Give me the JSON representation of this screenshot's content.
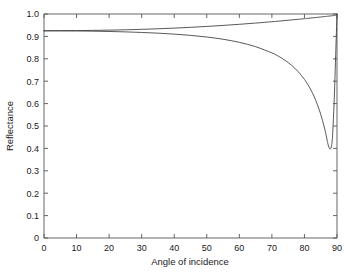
{
  "chart_data": {
    "type": "line",
    "title": "",
    "xlabel": "Angle of incidence",
    "ylabel": "Reflectance",
    "xlim": [
      0,
      90
    ],
    "ylim": [
      0,
      1.0
    ],
    "grid": false,
    "legend": "none",
    "xticks": [
      0,
      10,
      20,
      30,
      40,
      50,
      60,
      70,
      80,
      90
    ],
    "xtick_labels": [
      "0",
      "10",
      "20",
      "30",
      "40",
      "50",
      "60",
      "70",
      "80",
      "90"
    ],
    "yticks": [
      0,
      0.1,
      0.2,
      0.3,
      0.4,
      0.5,
      0.6,
      0.7,
      0.8,
      0.9,
      1.0
    ],
    "ytick_labels": [
      "0",
      "0.1",
      "0.2",
      "0.3",
      "0.4",
      "0.5",
      "0.6",
      "0.7",
      "0.8",
      "0.9",
      "1.0"
    ],
    "line_color": "#3a3a3a",
    "axis_color": "#555555",
    "background": "#ffffff",
    "x": [
      0,
      5,
      10,
      15,
      20,
      25,
      30,
      35,
      40,
      45,
      50,
      55,
      60,
      65,
      70,
      72,
      74,
      76,
      78,
      80,
      81,
      82,
      83,
      84,
      85,
      86,
      86.5,
      87,
      87.2,
      87.5,
      87.8,
      88,
      88.3,
      88.6,
      89,
      89.3,
      89.6,
      90
    ],
    "series": [
      {
        "name": "s-polarized reflectance",
        "values": [
          0.925,
          0.9255,
          0.926,
          0.9268,
          0.928,
          0.9295,
          0.9315,
          0.934,
          0.937,
          0.9405,
          0.9445,
          0.949,
          0.954,
          0.9595,
          0.9655,
          0.968,
          0.9707,
          0.9735,
          0.9763,
          0.979,
          0.9805,
          0.982,
          0.9835,
          0.985,
          0.9866,
          0.9882,
          0.989,
          0.9898,
          0.9901,
          0.9906,
          0.991,
          0.9914,
          0.9919,
          0.9924,
          0.9932,
          0.9939,
          0.9948,
          1.0
        ]
      },
      {
        "name": "p-polarized reflectance",
        "values": [
          0.925,
          0.9248,
          0.9243,
          0.9234,
          0.922,
          0.9202,
          0.9177,
          0.9144,
          0.9102,
          0.9046,
          0.8973,
          0.8873,
          0.8735,
          0.8542,
          0.8262,
          0.8115,
          0.7936,
          0.7715,
          0.7438,
          0.708,
          0.686,
          0.6605,
          0.6305,
          0.5948,
          0.552,
          0.5,
          0.47,
          0.435,
          0.421,
          0.4055,
          0.398,
          0.3975,
          0.4105,
          0.448,
          0.565,
          0.682,
          0.82,
          1.0
        ]
      }
    ],
    "annotations": []
  }
}
